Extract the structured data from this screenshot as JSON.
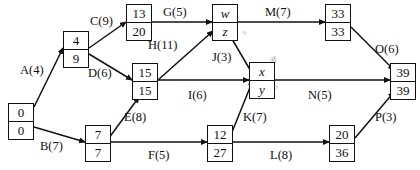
{
  "diagram": {
    "type": "activity-network",
    "line_color": "#111111",
    "background": "#ffffff",
    "nodes": [
      {
        "id": "n0",
        "top": "0",
        "bottom": "0",
        "italic": false,
        "x": 8,
        "y": 103
      },
      {
        "id": "n1",
        "top": "4",
        "bottom": "9",
        "italic": false,
        "x": 63,
        "y": 31
      },
      {
        "id": "n2",
        "top": "13",
        "bottom": "20",
        "italic": false,
        "x": 126,
        "y": 4
      },
      {
        "id": "n3",
        "top": "15",
        "bottom": "15",
        "italic": false,
        "x": 132,
        "y": 63
      },
      {
        "id": "n4",
        "top": "7",
        "bottom": "7",
        "italic": false,
        "x": 85,
        "y": 125
      },
      {
        "id": "n5",
        "top": "w",
        "bottom": "z",
        "italic": true,
        "x": 212,
        "y": 4
      },
      {
        "id": "n6",
        "top": "x",
        "bottom": "y",
        "italic": true,
        "x": 249,
        "y": 62
      },
      {
        "id": "n7",
        "top": "12",
        "bottom": "27",
        "italic": false,
        "x": 207,
        "y": 125
      },
      {
        "id": "n8",
        "top": "33",
        "bottom": "33",
        "italic": false,
        "x": 325,
        "y": 4
      },
      {
        "id": "n9",
        "top": "20",
        "bottom": "36",
        "italic": false,
        "x": 329,
        "y": 125
      },
      {
        "id": "n10",
        "top": "39",
        "bottom": "39",
        "italic": false,
        "x": 390,
        "y": 63
      }
    ],
    "edges": [
      {
        "id": "A",
        "label": "A(4)",
        "from": "n0",
        "to": "n1",
        "lx": 20,
        "ly": 63
      },
      {
        "id": "B",
        "label": "B(7)",
        "from": "n0",
        "to": "n4",
        "lx": 40,
        "ly": 139
      },
      {
        "id": "C",
        "label": "C(9)",
        "from": "n1",
        "to": "n2",
        "lx": 90,
        "ly": 14
      },
      {
        "id": "D",
        "label": "D(6)",
        "from": "n1",
        "to": "n3",
        "lx": 88,
        "ly": 66
      },
      {
        "id": "E",
        "label": "E(8)",
        "from": "n4",
        "to": "n3",
        "lx": 124,
        "ly": 110
      },
      {
        "id": "F",
        "label": "F(5)",
        "from": "n4",
        "to": "n7",
        "lx": 148,
        "ly": 148
      },
      {
        "id": "G",
        "label": "G(5)",
        "from": "n2",
        "to": "n5",
        "lx": 163,
        "ly": 5
      },
      {
        "id": "H",
        "label": "H(11)",
        "from": "n3",
        "to": "n5",
        "lx": 148,
        "ly": 38
      },
      {
        "id": "J",
        "label": "J(3)",
        "from": "n5",
        "to": "n6",
        "lx": 212,
        "ly": 50
      },
      {
        "id": "I",
        "label": "I(6)",
        "from": "n3",
        "to": "n6",
        "lx": 188,
        "ly": 88
      },
      {
        "id": "K",
        "label": "K(7)",
        "from": "n7",
        "to": "n6",
        "lx": 243,
        "ly": 110
      },
      {
        "id": "L",
        "label": "L(8)",
        "from": "n7",
        "to": "n9",
        "lx": 270,
        "ly": 148
      },
      {
        "id": "M",
        "label": "M(7)",
        "from": "n5",
        "to": "n8",
        "lx": 265,
        "ly": 5
      },
      {
        "id": "N",
        "label": "N(5)",
        "from": "n6",
        "to": "n10",
        "lx": 308,
        "ly": 88
      },
      {
        "id": "O",
        "label": "O(6)",
        "from": "n8",
        "to": "n10",
        "lx": 375,
        "ly": 42
      },
      {
        "id": "P",
        "label": "P(3)",
        "from": "n9",
        "to": "n10",
        "lx": 375,
        "ly": 110
      }
    ],
    "annotations": [
      {
        "id": "a1",
        "text": "√",
        "x": 234,
        "y": 4
      },
      {
        "id": "a2",
        "text": "∿",
        "x": 240,
        "y": 28
      },
      {
        "id": "a3",
        "text": "清",
        "x": 268,
        "y": 54
      },
      {
        "id": "a4",
        "text": "з",
        "x": 275,
        "y": 82
      }
    ]
  }
}
